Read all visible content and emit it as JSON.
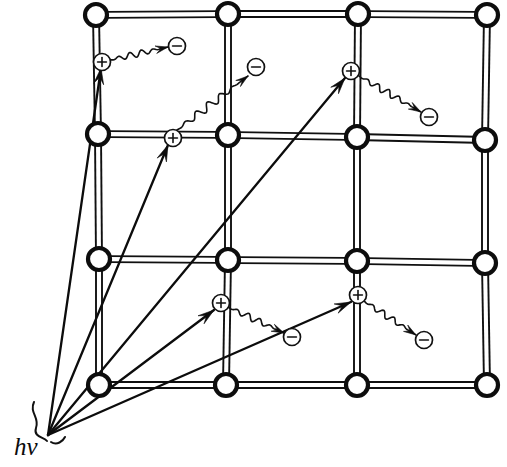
{
  "figure": {
    "background_color": "#ffffff",
    "ink_color": "#101010",
    "width": 507,
    "height": 467
  },
  "photon_source": {
    "label": "hν",
    "label_x": 14,
    "label_y": 455,
    "origin_x": 48,
    "origin_y": 435,
    "description": "incident photon source point where all rays converge"
  },
  "lattice": {
    "rows": 4,
    "columns": 4,
    "node_radius": 11,
    "node_fill": "#ffffff",
    "node_stroke": "#0d0d0d",
    "bond_style": "double-line",
    "bond_gap": 6,
    "nodes": [
      {
        "row": 0,
        "col": 0,
        "x": 96,
        "y": 15
      },
      {
        "row": 0,
        "col": 1,
        "x": 228,
        "y": 14
      },
      {
        "row": 0,
        "col": 2,
        "x": 358,
        "y": 14
      },
      {
        "row": 0,
        "col": 3,
        "x": 487,
        "y": 15
      },
      {
        "row": 1,
        "col": 0,
        "x": 98,
        "y": 134
      },
      {
        "row": 1,
        "col": 1,
        "x": 228,
        "y": 135
      },
      {
        "row": 1,
        "col": 2,
        "x": 357,
        "y": 137
      },
      {
        "row": 1,
        "col": 3,
        "x": 485,
        "y": 140
      },
      {
        "row": 2,
        "col": 0,
        "x": 99,
        "y": 259
      },
      {
        "row": 2,
        "col": 1,
        "x": 228,
        "y": 260
      },
      {
        "row": 2,
        "col": 2,
        "x": 357,
        "y": 261
      },
      {
        "row": 2,
        "col": 3,
        "x": 485,
        "y": 263
      },
      {
        "row": 3,
        "col": 0,
        "x": 99,
        "y": 385
      },
      {
        "row": 3,
        "col": 1,
        "x": 226,
        "y": 385
      },
      {
        "row": 3,
        "col": 2,
        "x": 357,
        "y": 385
      },
      {
        "row": 3,
        "col": 3,
        "x": 487,
        "y": 385
      }
    ]
  },
  "charges": {
    "positive_symbol": "+",
    "negative_symbol": "−",
    "circle_radius": 8.5,
    "positive_name": "hole",
    "negative_name": "electron"
  },
  "excitation_events": [
    {
      "id": 1,
      "ray": {
        "x1": 48,
        "y1": 435,
        "x2": 101,
        "y2": 68
      },
      "hole": {
        "x": 102,
        "y": 62,
        "sign": "+"
      },
      "electron": {
        "x": 177,
        "y": 46,
        "sign": "−"
      },
      "wave": {
        "from_x": 110,
        "from_y": 60,
        "to_x": 168,
        "to_y": 47,
        "amplitude": 3.2,
        "cycles": 5
      }
    },
    {
      "id": 2,
      "ray": {
        "x1": 48,
        "y1": 435,
        "x2": 168,
        "y2": 145
      },
      "hole": {
        "x": 173,
        "y": 138,
        "sign": "+"
      },
      "electron": {
        "x": 256,
        "y": 67,
        "sign": "−"
      },
      "wave": {
        "from_x": 177,
        "from_y": 130,
        "to_x": 248,
        "to_y": 76,
        "amplitude": 4.0,
        "cycles": 6
      }
    },
    {
      "id": 3,
      "ray": {
        "x1": 48,
        "y1": 435,
        "x2": 345,
        "y2": 78
      },
      "hole": {
        "x": 351,
        "y": 71,
        "sign": "+"
      },
      "electron": {
        "x": 429,
        "y": 117,
        "sign": "−"
      },
      "wave": {
        "from_x": 359,
        "from_y": 76,
        "to_x": 421,
        "to_y": 112,
        "amplitude": 3.4,
        "cycles": 6
      }
    },
    {
      "id": 4,
      "ray": {
        "x1": 48,
        "y1": 435,
        "x2": 214,
        "y2": 310
      },
      "hole": {
        "x": 221,
        "y": 303,
        "sign": "+"
      },
      "electron": {
        "x": 292,
        "y": 337,
        "sign": "−"
      },
      "wave": {
        "from_x": 228,
        "from_y": 307,
        "to_x": 284,
        "to_y": 333,
        "amplitude": 3.2,
        "cycles": 5
      }
    },
    {
      "id": 5,
      "ray": {
        "x1": 48,
        "y1": 435,
        "x2": 351,
        "y2": 302
      },
      "hole": {
        "x": 358,
        "y": 295,
        "sign": "+"
      },
      "electron": {
        "x": 424,
        "y": 340,
        "sign": "−"
      },
      "wave": {
        "from_x": 364,
        "from_y": 301,
        "to_x": 416,
        "to_y": 335,
        "amplitude": 3.2,
        "cycles": 5
      }
    }
  ]
}
